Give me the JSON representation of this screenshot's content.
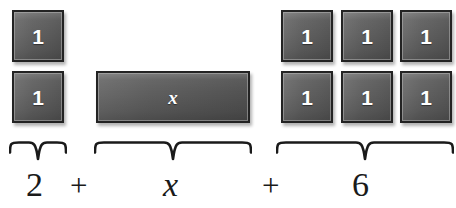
{
  "canvas": {
    "width": 456,
    "height": 208,
    "background": "#ffffff"
  },
  "theme": {
    "tile_fill_light": "#6e6e6e",
    "tile_fill_dark": "#525252",
    "tile_border": "#232323",
    "tile_bevel": "#b4b4b4",
    "tile_glyph_color": "#ffffff",
    "text_color": "#1a1a1a",
    "brace_color": "#1a1a1a"
  },
  "groups": [
    {
      "id": "constant-left",
      "label": "2",
      "tile_type": "unit",
      "count": 2,
      "tile_label": "1"
    },
    {
      "id": "variable",
      "label": "x",
      "tile_type": "x-bar",
      "count": 1,
      "tile_label": "x"
    },
    {
      "id": "constant-right",
      "label": "6",
      "tile_type": "unit",
      "count": 6,
      "tile_label": "1"
    }
  ],
  "tiles": [
    {
      "name": "unit-tile-left-1",
      "label": "1",
      "x": 12,
      "y": 10,
      "w": 52,
      "h": 52,
      "kind": "unit"
    },
    {
      "name": "unit-tile-left-2",
      "label": "1",
      "x": 12,
      "y": 71,
      "w": 52,
      "h": 52,
      "kind": "unit"
    },
    {
      "name": "x-bar-tile",
      "label": "x",
      "x": 96,
      "y": 71,
      "w": 154,
      "h": 52,
      "kind": "xbar"
    },
    {
      "name": "unit-tile-right-1",
      "label": "1",
      "x": 281,
      "y": 10,
      "w": 52,
      "h": 52,
      "kind": "unit"
    },
    {
      "name": "unit-tile-right-2",
      "label": "1",
      "x": 341,
      "y": 10,
      "w": 52,
      "h": 52,
      "kind": "unit"
    },
    {
      "name": "unit-tile-right-3",
      "label": "1",
      "x": 400,
      "y": 10,
      "w": 52,
      "h": 52,
      "kind": "unit"
    },
    {
      "name": "unit-tile-right-4",
      "label": "1",
      "x": 281,
      "y": 71,
      "w": 52,
      "h": 52,
      "kind": "unit"
    },
    {
      "name": "unit-tile-right-5",
      "label": "1",
      "x": 341,
      "y": 71,
      "w": 52,
      "h": 52,
      "kind": "unit"
    },
    {
      "name": "unit-tile-right-6",
      "label": "1",
      "x": 400,
      "y": 71,
      "w": 52,
      "h": 52,
      "kind": "unit"
    }
  ],
  "braces": [
    {
      "name": "brace-constant-left",
      "x": 9,
      "y": 140,
      "w": 58,
      "h": 22
    },
    {
      "name": "brace-variable",
      "x": 94,
      "y": 140,
      "w": 158,
      "h": 22
    },
    {
      "name": "brace-constant-right",
      "x": 276,
      "y": 140,
      "w": 178,
      "h": 22
    }
  ],
  "equation": {
    "full": "2 + x + 6",
    "terms": [
      {
        "name": "term-two",
        "text": "2",
        "x": 26,
        "y": 168,
        "style": "roman"
      },
      {
        "name": "operator-plus-1",
        "text": "+",
        "x": 70,
        "y": 170,
        "style": "plus"
      },
      {
        "name": "term-x",
        "text": "x",
        "x": 163,
        "y": 168,
        "style": "italic"
      },
      {
        "name": "operator-plus-2",
        "text": "+",
        "x": 262,
        "y": 170,
        "style": "plus"
      },
      {
        "name": "term-six",
        "text": "6",
        "x": 352,
        "y": 168,
        "style": "roman"
      }
    ]
  }
}
